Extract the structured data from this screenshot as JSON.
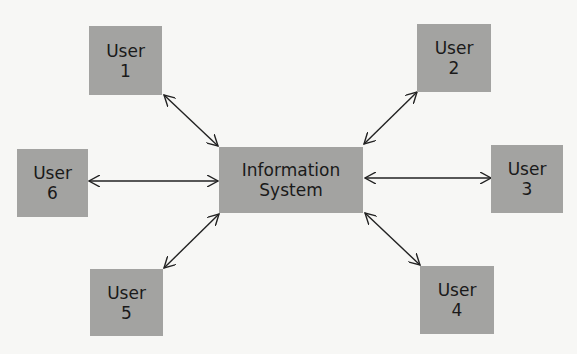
{
  "diagram": {
    "center": {
      "line1": "Information",
      "line2": "System"
    },
    "users": [
      {
        "label": "User",
        "number": "1"
      },
      {
        "label": "User",
        "number": "2"
      },
      {
        "label": "User",
        "number": "3"
      },
      {
        "label": "User",
        "number": "4"
      },
      {
        "label": "User",
        "number": "5"
      },
      {
        "label": "User",
        "number": "6"
      }
    ],
    "connections": [
      {
        "from": "User 1",
        "to": "Information System",
        "type": "bidirectional"
      },
      {
        "from": "User 2",
        "to": "Information System",
        "type": "bidirectional"
      },
      {
        "from": "User 3",
        "to": "Information System",
        "type": "bidirectional"
      },
      {
        "from": "User 4",
        "to": "Information System",
        "type": "bidirectional"
      },
      {
        "from": "User 5",
        "to": "Information System",
        "type": "bidirectional"
      },
      {
        "from": "User 6",
        "to": "Information System",
        "type": "bidirectional"
      }
    ]
  }
}
